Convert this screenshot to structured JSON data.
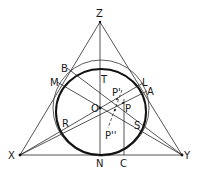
{
  "diagram": {
    "colors": {
      "line": "#2a2a2a",
      "thick_curve": "#111111",
      "background": "#ffffff"
    },
    "points": {
      "Z": {
        "label": "Z",
        "x": 100,
        "y": 22
      },
      "X": {
        "label": "X",
        "x": 20,
        "y": 155
      },
      "Y": {
        "label": "Y",
        "x": 182,
        "y": 155
      },
      "O": {
        "label": "O",
        "x": 100,
        "y": 108
      },
      "T": {
        "label": "T",
        "x": 100,
        "y": 70
      },
      "N": {
        "label": "N",
        "x": 100,
        "y": 155
      },
      "C": {
        "label": "C",
        "x": 124,
        "y": 155
      },
      "B": {
        "label": "B",
        "x": 67,
        "y": 68
      },
      "M": {
        "label": "M",
        "x": 57,
        "y": 82
      },
      "L": {
        "label": "L",
        "x": 143,
        "y": 83
      },
      "A": {
        "label": "A",
        "x": 147,
        "y": 91
      },
      "R": {
        "label": "R",
        "x": 62,
        "y": 131
      },
      "S": {
        "label": "S",
        "x": 139,
        "y": 125
      },
      "P": {
        "label": "P",
        "x": 123,
        "y": 103
      },
      "P1": {
        "label": "P'",
        "x": 117,
        "y": 99
      },
      "P2": {
        "label": "P''",
        "x": 112,
        "y": 121
      }
    },
    "labels": {
      "Z": "Z",
      "X": "X",
      "Y": "Y",
      "O": "O",
      "T": "T",
      "N": "N",
      "C": "C",
      "B": "B",
      "M": "M",
      "L": "L",
      "A": "A",
      "R": "R",
      "S": "S",
      "P": "P",
      "P1": "P'",
      "P2": "P''"
    },
    "curves": [
      {
        "name": "inscribed-ellipse",
        "type": "ellipse",
        "cx": 101,
        "cy": 112,
        "rx": 45,
        "ry": 43,
        "weight": "thick"
      },
      {
        "name": "outer-circle",
        "type": "circle",
        "cx": 101,
        "cy": 108,
        "r": 48,
        "weight": "thin"
      }
    ],
    "segments": [
      {
        "from": "X",
        "to": "Y"
      },
      {
        "from": "X",
        "to": "Z"
      },
      {
        "from": "Y",
        "to": "Z"
      },
      {
        "from": "Z",
        "to": "N"
      },
      {
        "from": "X",
        "to": "L",
        "via": "O"
      },
      {
        "from": "X",
        "to": "A",
        "via": "P"
      },
      {
        "from": "M",
        "to": "Y",
        "via": "O"
      },
      {
        "from": "B",
        "to": "Y",
        "via": "P'"
      },
      {
        "from": "C",
        "to": "P",
        "style": "vertical"
      },
      {
        "from": "P'",
        "to": "P''",
        "style": "dashed"
      }
    ]
  }
}
